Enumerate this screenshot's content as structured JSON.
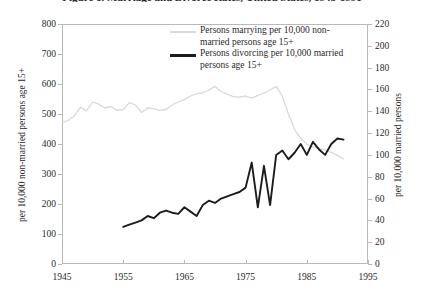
{
  "chart_data": {
    "type": "line",
    "title": "Figure 1. Marriage and Divorce Rates, United States, 1945-1991",
    "xlabel": "",
    "ylabel": "per 10,000 non-married persons age 15+",
    "y2label": "per 10,000 married persons",
    "xlim": [
      1945,
      1995
    ],
    "ylim": [
      0,
      800
    ],
    "y2lim": [
      0,
      220
    ],
    "xticks": [
      1945,
      1955,
      1965,
      1975,
      1985,
      1995
    ],
    "yticks": [
      0,
      100,
      200,
      300,
      400,
      500,
      600,
      700,
      800
    ],
    "y2ticks": [
      0,
      20,
      40,
      60,
      80,
      100,
      120,
      140,
      160,
      180,
      200,
      220
    ],
    "grid": false,
    "legend_position": "top-center",
    "series": [
      {
        "name": "Persons marrying per 10,000 non-married persons age 15+",
        "axis": "left",
        "color": "#d9d9d9",
        "x": [
          1945,
          1946,
          1947,
          1948,
          1949,
          1950,
          1951,
          1952,
          1953,
          1954,
          1955,
          1956,
          1957,
          1958,
          1959,
          1960,
          1961,
          1962,
          1963,
          1964,
          1965,
          1966,
          1967,
          1968,
          1969,
          1970,
          1971,
          1972,
          1973,
          1974,
          1975,
          1976,
          1977,
          1978,
          1979,
          1980,
          1981,
          1982,
          1983,
          1984,
          1985,
          1986,
          1987,
          1988,
          1989,
          1990,
          1991
        ],
        "values": [
          472,
          478,
          494,
          523,
          510,
          540,
          533,
          520,
          525,
          512,
          515,
          538,
          530,
          505,
          520,
          518,
          512,
          515,
          530,
          540,
          548,
          560,
          568,
          570,
          580,
          592,
          575,
          566,
          558,
          556,
          560,
          553,
          562,
          570,
          580,
          592,
          560,
          500,
          448,
          420,
          400,
          390,
          385,
          380,
          372,
          362,
          350
        ]
      },
      {
        "name": "Persons divorcing per 10,000 married persons age 15+",
        "axis": "right",
        "color": "#1c1c1c",
        "x": [
          1955,
          1956,
          1957,
          1958,
          1959,
          1960,
          1961,
          1962,
          1963,
          1964,
          1965,
          1966,
          1967,
          1968,
          1969,
          1970,
          1971,
          1972,
          1973,
          1974,
          1975,
          1976,
          1977,
          1978,
          1979,
          1980,
          1981,
          1982,
          1983,
          1984,
          1985,
          1986,
          1987,
          1988,
          1989,
          1990,
          1991
        ],
        "values": [
          34,
          36,
          38,
          40,
          44,
          42,
          47,
          49,
          47,
          46,
          52,
          48,
          44,
          54,
          58,
          56,
          60,
          62,
          64,
          66,
          70,
          93,
          52,
          90,
          54,
          100,
          104,
          96,
          102,
          110,
          100,
          112,
          105,
          100,
          110,
          115,
          114
        ]
      }
    ]
  },
  "axes": {
    "left_tick_labels": [
      "800",
      "700",
      "600",
      "500",
      "400",
      "300",
      "200",
      "100",
      "0"
    ],
    "right_tick_labels": [
      "220",
      "200",
      "180",
      "160",
      "140",
      "120",
      "100",
      "80",
      "60",
      "40",
      "20",
      "0"
    ],
    "x_tick_labels": [
      "1945",
      "1955",
      "1965",
      "1975",
      "1985",
      "1995"
    ],
    "left_axis_title": "per 10,000 non-married persons age 15+",
    "right_axis_title": "per 10,000 married persons"
  },
  "legend": {
    "entries": [
      {
        "label": "Persons marrying per 10,000 non-married persons age 15+",
        "color": "#d9d9d9",
        "style": "thin-gray"
      },
      {
        "label": "Persons divorcing per 10,000 married persons age 15+",
        "color": "#1c1c1c",
        "style": "thick-black"
      }
    ]
  }
}
